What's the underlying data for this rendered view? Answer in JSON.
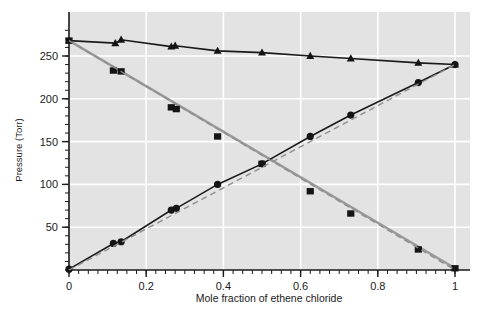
{
  "chart_data": {
    "type": "scatter",
    "title": "",
    "xlabel": "Mole fraction of ethene chloride",
    "ylabel": "Pressure (Torr)",
    "xlim": [
      0,
      1.06
    ],
    "ylim": [
      0,
      288
    ],
    "xticks": [
      0,
      0.2,
      0.4,
      0.6,
      0.8,
      1
    ],
    "xticklabels": [
      "0",
      "0.2",
      "0.4",
      "0.6",
      "0.8",
      "1"
    ],
    "yticks": [
      50,
      100,
      150,
      200,
      250
    ],
    "yticklabels": [
      "50",
      "100",
      "150",
      "200",
      "250"
    ],
    "x_minor_step": 0.025,
    "y_minor_step": 10,
    "grid": "white gridlines on light gray panel, major only",
    "legend": "none",
    "series": [
      {
        "name": "total-vapour-pressure-upper-curve",
        "marker": "triangle",
        "color": "#1a1a1a",
        "linestyle": "solid",
        "points": [
          {
            "x": 0.0,
            "y": 268
          },
          {
            "x": 0.12,
            "y": 265
          },
          {
            "x": 0.135,
            "y": 269
          },
          {
            "x": 0.265,
            "y": 261
          },
          {
            "x": 0.275,
            "y": 262
          },
          {
            "x": 0.385,
            "y": 256
          },
          {
            "x": 0.5,
            "y": 254
          },
          {
            "x": 0.625,
            "y": 250
          },
          {
            "x": 0.73,
            "y": 247
          },
          {
            "x": 0.905,
            "y": 242
          },
          {
            "x": 1.0,
            "y": 240
          }
        ]
      },
      {
        "name": "partial-pressure-descending-squares",
        "marker": "square",
        "color": "#1a1a1a",
        "linestyle": "solid-gray-fit",
        "points": [
          {
            "x": 0.0,
            "y": 268
          },
          {
            "x": 0.115,
            "y": 233
          },
          {
            "x": 0.135,
            "y": 232
          },
          {
            "x": 0.265,
            "y": 190
          },
          {
            "x": 0.278,
            "y": 188
          },
          {
            "x": 0.385,
            "y": 156
          },
          {
            "x": 0.5,
            "y": 124
          },
          {
            "x": 0.625,
            "y": 92
          },
          {
            "x": 0.73,
            "y": 66
          },
          {
            "x": 0.905,
            "y": 24
          },
          {
            "x": 1.0,
            "y": 2
          }
        ]
      },
      {
        "name": "partial-pressure-ascending-circles",
        "marker": "circle",
        "color": "#1a1a1a",
        "linestyle": "solid",
        "points": [
          {
            "x": 0.0,
            "y": 1
          },
          {
            "x": 0.115,
            "y": 31
          },
          {
            "x": 0.135,
            "y": 33
          },
          {
            "x": 0.265,
            "y": 70
          },
          {
            "x": 0.278,
            "y": 72
          },
          {
            "x": 0.385,
            "y": 100
          },
          {
            "x": 0.5,
            "y": 124
          },
          {
            "x": 0.625,
            "y": 156
          },
          {
            "x": 0.73,
            "y": 181
          },
          {
            "x": 0.905,
            "y": 219
          },
          {
            "x": 1.0,
            "y": 240
          }
        ]
      },
      {
        "name": "raoult-law-ideal-line-descending",
        "marker": "none",
        "color": "#8c8c8c",
        "linestyle": "dashed",
        "points": [
          {
            "x": 0.0,
            "y": 268
          },
          {
            "x": 1.0,
            "y": 0
          }
        ]
      },
      {
        "name": "raoult-law-ideal-line-ascending",
        "marker": "none",
        "color": "#8c8c8c",
        "linestyle": "dashed",
        "points": [
          {
            "x": 0.0,
            "y": 0
          },
          {
            "x": 1.0,
            "y": 240
          }
        ]
      }
    ]
  },
  "colors": {
    "panel_background": "#e3e3e3",
    "gridline": "#ffffff",
    "axis": "#1a1a1a",
    "marker": "#141414",
    "dashed_line": "#8f8f8f",
    "gray_solid_line": "#999999",
    "page_background": "#ffffff"
  }
}
